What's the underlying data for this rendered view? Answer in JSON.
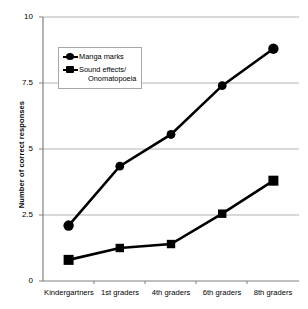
{
  "chart_data": {
    "type": "line",
    "title": "",
    "xlabel": "",
    "ylabel": "Number of correct responses",
    "categories": [
      "Kindergartners",
      "1st graders",
      "4th graders",
      "6th graders",
      "8th graders"
    ],
    "series": [
      {
        "name": "Manga marks",
        "marker": "circle",
        "values": [
          2.1,
          4.35,
          5.55,
          7.4,
          8.8
        ]
      },
      {
        "name": "Sound effects/ Onomatopoeia",
        "marker": "square",
        "values": [
          0.8,
          1.25,
          1.4,
          2.55,
          3.8
        ]
      }
    ],
    "ylim": [
      0,
      10
    ],
    "yticks": [
      0,
      2.5,
      5,
      7.5,
      10
    ],
    "ytick_labels": [
      "0",
      "2.5",
      "5",
      "7.5",
      "10"
    ],
    "grid": "horizontal",
    "legend_position": "upper-left-inside",
    "line_color": "#000000",
    "grid_color": "#b3b3b3",
    "axis_color": "#808080"
  },
  "legend": {
    "entries": [
      {
        "label": "Manga marks",
        "label_line2": ""
      },
      {
        "label": "Sound effects/",
        "label_line2": "Onomatopoeia"
      }
    ]
  }
}
